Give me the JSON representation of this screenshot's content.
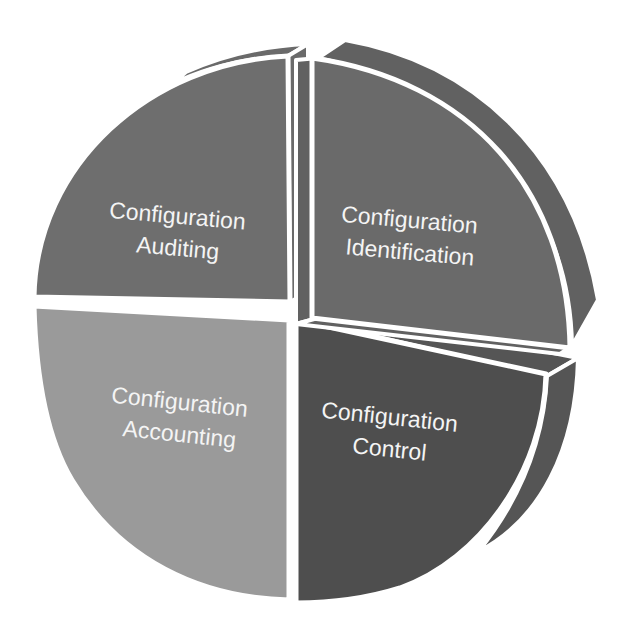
{
  "diagram": {
    "type": "exploded-3d-pie",
    "segments": [
      {
        "id": "auditing",
        "position": "top-left",
        "line1": "Configuration",
        "line2": "Auditing",
        "color": "#6e6e6e",
        "side_color": "#6a6a6a",
        "exploded": false
      },
      {
        "id": "identification",
        "position": "top-right",
        "line1": "Configuration",
        "line2": "Identification",
        "color": "#6a6a6a",
        "side_color": "#616161",
        "exploded": true
      },
      {
        "id": "control",
        "position": "bottom-right",
        "line1": "Configuration",
        "line2": "Control",
        "color": "#4e4e4e",
        "side_color": "#555555",
        "exploded": false
      },
      {
        "id": "accounting",
        "position": "bottom-left",
        "line1": "Configuration",
        "line2": "Accounting",
        "color": "#9a9a9a",
        "side_color": "#8e8e8e",
        "exploded": false
      }
    ],
    "separator_color": "#ffffff",
    "background": "#ffffff"
  }
}
